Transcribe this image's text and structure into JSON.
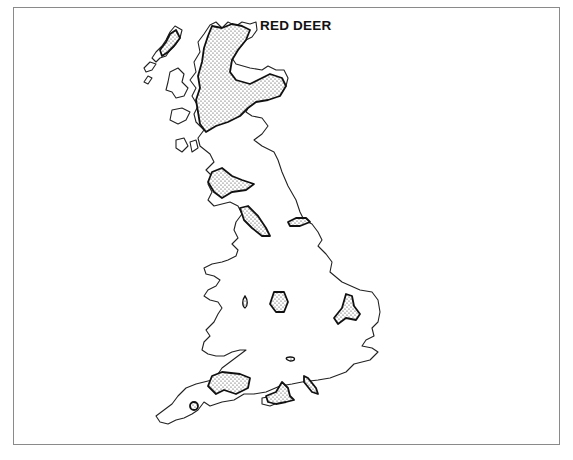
{
  "map": {
    "title": "RED DEER",
    "region": "Great Britain",
    "legend_note": "Stippled areas indicate distribution",
    "colors": {
      "outline": "#222222",
      "stipple": "#333333",
      "background": "#ffffff",
      "frame": "#8a8a8a"
    },
    "distribution_areas": [
      {
        "name": "Scottish Highlands"
      },
      {
        "name": "Galloway"
      },
      {
        "name": "Lake District"
      },
      {
        "name": "North York Moors"
      },
      {
        "name": "Peak District / Cannock area"
      },
      {
        "name": "Central Midlands"
      },
      {
        "name": "Thetford / East Anglia"
      },
      {
        "name": "Exmoor and Quantocks"
      },
      {
        "name": "New Forest"
      },
      {
        "name": "Bodmin area"
      }
    ]
  }
}
